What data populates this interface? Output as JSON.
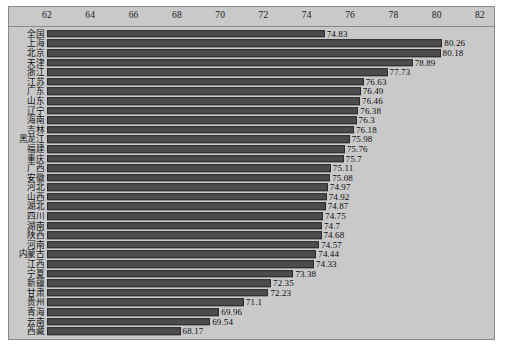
{
  "chart_data": {
    "type": "bar",
    "orientation": "horizontal",
    "title": "",
    "xlabel": "",
    "ylabel": "",
    "xlim": [
      62,
      82
    ],
    "xticks": [
      62,
      64,
      66,
      68,
      70,
      72,
      74,
      76,
      78,
      80,
      82
    ],
    "grid": false,
    "legend": null,
    "bar_color": "#4c4c4c",
    "plot_background": "#c9c9c9",
    "categories": [
      "全国",
      "上海",
      "北京",
      "天津",
      "浙江",
      "江苏",
      "广东",
      "山东",
      "辽宁",
      "海南",
      "吉林",
      "黑龙江",
      "福建",
      "重庆",
      "广西",
      "安徽",
      "河北",
      "山西",
      "湖北",
      "四川",
      "湖南",
      "陕西",
      "河南",
      "内蒙古",
      "江西",
      "宁夏",
      "新疆",
      "甘肃",
      "贵州",
      "青海",
      "云南",
      "西藏"
    ],
    "values": [
      74.83,
      80.26,
      80.18,
      78.89,
      77.73,
      76.63,
      76.49,
      76.46,
      76.38,
      76.3,
      76.18,
      75.98,
      75.76,
      75.7,
      75.11,
      75.08,
      74.97,
      74.92,
      74.87,
      74.75,
      74.7,
      74.68,
      74.57,
      74.44,
      74.33,
      73.38,
      72.35,
      72.23,
      71.1,
      69.96,
      69.54,
      68.17
    ],
    "value_labels": [
      "74.83",
      "80.26",
      "80.18",
      "78.89",
      "77.73",
      "76.63",
      "76.49",
      "76.46",
      "76.38",
      "76.3",
      "76.18",
      "75.98",
      "75.76",
      "75.7",
      "75.11",
      "75.08",
      "74.97",
      "74.92",
      "74.87",
      "74.75",
      "74.7",
      "74.68",
      "74.57",
      "74.44",
      "74.33",
      "73.38",
      "72.35",
      "72.23",
      "71.1",
      "69.96",
      "69.54",
      "68.17"
    ]
  }
}
